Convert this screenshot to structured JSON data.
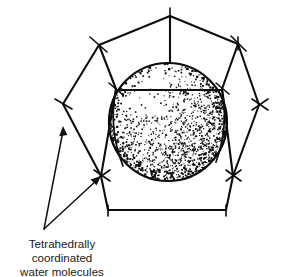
{
  "figure": {
    "background_color": "#ffffff",
    "ink_color": "#0d0d0d",
    "caption": {
      "line1": "Tetrahedrally",
      "line2": "coordinated",
      "line3": "water molecules",
      "full_text": "Tetrahedrally coordinated water molecules",
      "align": "center",
      "font_size_px": 11.6,
      "color": "#1a1a1a",
      "x_center": 62,
      "y_first_line": 242
    },
    "annotations": {
      "leader_count": 2,
      "leader_origin": {
        "x": 44,
        "y": 229
      },
      "leaders": [
        {
          "name": "leader-to-left-vertex",
          "from": {
            "x": 44,
            "y": 229
          },
          "to": {
            "x": 63,
            "y": 130
          },
          "target": "left-middle-cage-vertex"
        },
        {
          "name": "leader-to-lower-left-vertex",
          "from": {
            "x": 44,
            "y": 229
          },
          "to": {
            "x": 101,
            "y": 176
          },
          "target": "lower-left-cage-vertex"
        }
      ]
    },
    "guest_sphere": {
      "name": "guest-molecule-sphere",
      "center": {
        "x": 168,
        "y": 122
      },
      "radius": 60,
      "fill": "#ffffff",
      "stroke": "#0a0a0a",
      "texture": "stippled",
      "shading": "dense stipple toward lower-right limb, light toward upper-left",
      "chord_y": 90,
      "chord_x1": 115,
      "chord_x2": 221,
      "label": "encapsulated guest sphere"
    },
    "cage": {
      "name": "water-cage-polyhedron",
      "description": "Hexagonal/pentagonal cage of hydrogen-bonded water molecules drawn as straight edges with tick-marked vertices",
      "vertex_count": 8,
      "vertices": [
        {
          "id": "v-top",
          "x": 170,
          "y": 16,
          "ticks": 1
        },
        {
          "id": "v-upper-left",
          "x": 99,
          "y": 45,
          "ticks": 2
        },
        {
          "id": "v-upper-right",
          "x": 238,
          "y": 44,
          "ticks": 2
        },
        {
          "id": "v-mid-left",
          "x": 63,
          "y": 104,
          "ticks": 2
        },
        {
          "id": "v-mid-right",
          "x": 259,
          "y": 105,
          "ticks": 2
        },
        {
          "id": "v-sphere-left",
          "x": 116,
          "y": 89,
          "ticks": 2
        },
        {
          "id": "v-sphere-right",
          "x": 222,
          "y": 89,
          "ticks": 1
        },
        {
          "id": "v-lower-left",
          "x": 101,
          "y": 176,
          "ticks": 2
        },
        {
          "id": "v-lower-right",
          "x": 233,
          "y": 176,
          "ticks": 2
        },
        {
          "id": "v-bottom-left",
          "x": 108,
          "y": 210,
          "ticks": 1
        },
        {
          "id": "v-bottom-right",
          "x": 226,
          "y": 210,
          "ticks": 1
        }
      ]
    },
    "colors": {
      "ink": "#0d0d0d",
      "paper": "#ffffff",
      "text": "#1a1a1a"
    }
  }
}
